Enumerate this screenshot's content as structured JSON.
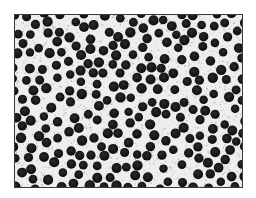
{
  "image": {
    "description": "Micrograph of densely packed dark circular particles on a light speckled background",
    "frame": {
      "x": 14,
      "y": 14,
      "width": 227,
      "height": 172,
      "border_color": "#3a3a3a"
    },
    "background_color": "#eeeeee",
    "speckle_color": "#9a9a9a",
    "particle_color": "#161616",
    "particle_radius_min": 4.2,
    "particle_radius_max": 5.2,
    "particle_min_spacing": 9.6,
    "particle_attempts": 2600,
    "speckle_count": 1800,
    "seed": 1337
  }
}
